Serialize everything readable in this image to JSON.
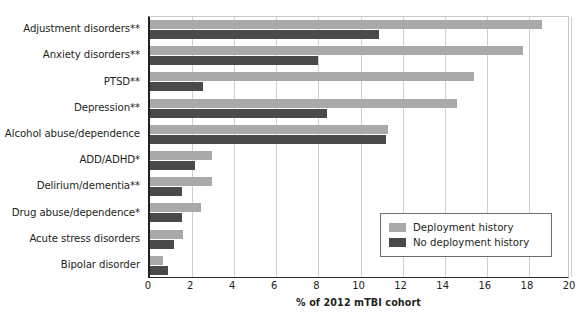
{
  "chart_data": {
    "type": "bar",
    "orientation": "horizontal",
    "title": "",
    "xlabel": "% of 2012 mTBI cohort",
    "ylabel": "",
    "xlim": [
      0,
      20
    ],
    "xticks": [
      0,
      2,
      4,
      6,
      8,
      10,
      12,
      14,
      16,
      18,
      20
    ],
    "grid": "vertical",
    "legend_position": "bottom-right",
    "categories": [
      "Adjustment disorders**",
      "Anxiety disorders**",
      "PTSD**",
      "Depression**",
      "Alcohol abuse/dependence",
      "ADD/ADHD*",
      "Delirium/dementia**",
      "Drug abuse/dependence*",
      "Acute stress disorders",
      "Bipolar disorder"
    ],
    "series": [
      {
        "name": "Deployment history",
        "color": "#a9a9a9",
        "values": [
          18.6,
          17.7,
          15.4,
          14.6,
          11.3,
          2.95,
          2.95,
          2.4,
          1.55,
          0.6
        ]
      },
      {
        "name": "No deployment history",
        "color": "#4a4a4a",
        "values": [
          10.9,
          8.0,
          2.5,
          8.4,
          11.2,
          2.15,
          1.5,
          1.5,
          1.15,
          0.85
        ]
      }
    ]
  },
  "legend": {
    "items": [
      {
        "label": "Deployment history",
        "color": "#a9a9a9"
      },
      {
        "label": "No deployment history",
        "color": "#4a4a4a"
      }
    ]
  },
  "axis": {
    "x_title": "% of 2012 mTBI cohort",
    "x_tick_labels": [
      "0",
      "2",
      "4",
      "6",
      "8",
      "10",
      "12",
      "14",
      "16",
      "18",
      "20"
    ]
  }
}
